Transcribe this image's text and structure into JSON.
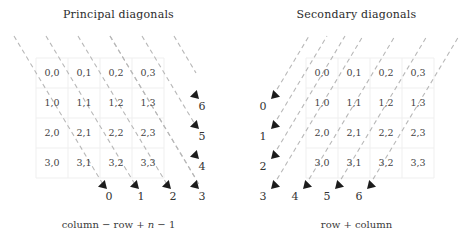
{
  "figure": {
    "panels": [
      {
        "id": "principal",
        "title": "Principal diagonals",
        "caption_prefix": "column − row + ",
        "caption_var": "n",
        "caption_suffix": " − 1",
        "direction": "down-right",
        "bottom_labels": [
          "0",
          "1",
          "2",
          "3"
        ],
        "side_labels": [
          "6",
          "5",
          "4"
        ],
        "corner_label": "3"
      },
      {
        "id": "secondary",
        "title": "Secondary diagonals",
        "caption_prefix": "row + column",
        "caption_var": "",
        "caption_suffix": "",
        "direction": "up-right",
        "side_labels": [
          "0",
          "1",
          "2"
        ],
        "corner_label": "3",
        "bottom_labels": [
          "4",
          "5",
          "6"
        ]
      }
    ],
    "matrix": {
      "rows": 4,
      "cols": 4,
      "cells": [
        [
          "0,0",
          "0,1",
          "0,2",
          "0,3"
        ],
        [
          "1,0",
          "1,1",
          "1,2",
          "1,3"
        ],
        [
          "2,0",
          "2,1",
          "2,2",
          "2,3"
        ],
        [
          "3,0",
          "3,1",
          "3,2",
          "3,3"
        ]
      ]
    },
    "colors": {
      "dash_line": "#b8b8b8",
      "grid_line": "#efefef",
      "arrow_head": "#1c1c1c",
      "cell_text": "#444444",
      "axis_text": "#333333",
      "title_text": "#2b2b2b"
    }
  }
}
